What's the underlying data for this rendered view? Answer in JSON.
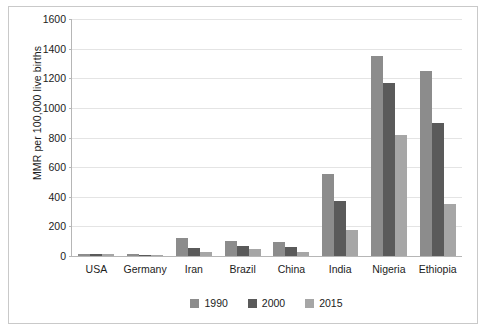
{
  "chart_data": {
    "type": "bar",
    "title": "",
    "xlabel": "",
    "ylabel": "MMR per 100,000 live births",
    "ylim": [
      0,
      1600
    ],
    "yticks": [
      0,
      200,
      400,
      600,
      800,
      1000,
      1200,
      1400,
      1600
    ],
    "grid": true,
    "legend_position": "bottom-center",
    "categories": [
      "USA",
      "Germany",
      "Iran",
      "Brazil",
      "China",
      "India",
      "Nigeria",
      "Ethiopia"
    ],
    "series": [
      {
        "name": "1990",
        "color": "#8c8c8c",
        "values": [
          12,
          13,
          123,
          104,
          97,
          556,
          1350,
          1250
        ]
      },
      {
        "name": "2000",
        "color": "#5a5a5a",
        "values": [
          14,
          8,
          55,
          66,
          58,
          374,
          1170,
          897
        ]
      },
      {
        "name": "2015",
        "color": "#a6a6a6",
        "values": [
          14,
          6,
          25,
          44,
          27,
          174,
          814,
          353
        ]
      }
    ]
  },
  "legend": {
    "items": [
      {
        "label": "1990",
        "color": "#8c8c8c"
      },
      {
        "label": "2000",
        "color": "#5a5a5a"
      },
      {
        "label": "2015",
        "color": "#a6a6a6"
      }
    ]
  }
}
